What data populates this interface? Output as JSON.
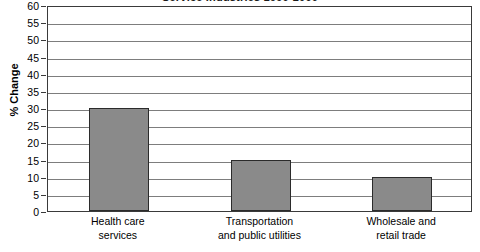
{
  "chart_data": {
    "type": "bar",
    "title": "Service Industries 1990-2000",
    "title_clipped": true,
    "xlabel": "",
    "ylabel": "% Change",
    "categories": [
      "Health care services",
      "Transportation and public utilities",
      "Wholesale and retail trade"
    ],
    "category_lines": [
      [
        "Health care",
        "services"
      ],
      [
        "Transportation",
        "and public utilities"
      ],
      [
        "Wholesale and",
        "retail trade"
      ]
    ],
    "values": [
      30,
      15,
      10
    ],
    "ylim": [
      0,
      60
    ],
    "ytick_step": 5,
    "ytick_labels": [
      "60",
      "55",
      "50",
      "45",
      "40",
      "35",
      "30",
      "25",
      "20",
      "15",
      "10",
      "5",
      "0"
    ],
    "grid": true,
    "grid_axis": "y",
    "legend": null,
    "colors": {
      "bar_fill": "#8a8a8a",
      "bar_border": "#2b2b2b",
      "gridline": "#7d7d7d",
      "frame": "#3a3a3a",
      "text": "#000000",
      "background": "#ffffff"
    }
  }
}
